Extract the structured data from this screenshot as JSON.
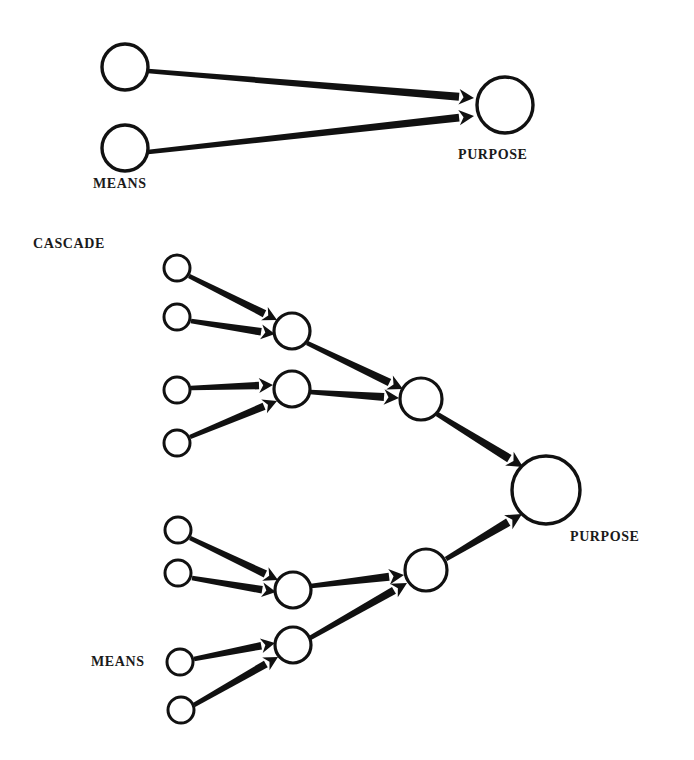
{
  "figure": {
    "background_color": "#ffffff",
    "ink_color": "#111111",
    "title": "",
    "panels": [
      {
        "id": "simple-panel",
        "name": "simple-means-purpose",
        "labels": [
          {
            "id": "simple-means-label",
            "text": "MEANS",
            "x": 93,
            "y": 188,
            "anchor": "start",
            "font_size": 14
          },
          {
            "id": "simple-purpose-label",
            "text": "PURPOSE",
            "x": 458,
            "y": 159,
            "anchor": "start",
            "font_size": 14
          }
        ],
        "nodes": [
          {
            "id": "s-m1",
            "name": "means-node-1",
            "cx": 125,
            "cy": 67,
            "r": 23,
            "stroke_width": 3.4
          },
          {
            "id": "s-m2",
            "name": "means-node-2",
            "cx": 125,
            "cy": 148,
            "r": 23,
            "stroke_width": 3.4
          },
          {
            "id": "s-p",
            "name": "purpose-node",
            "cx": 505,
            "cy": 105,
            "r": 28,
            "stroke_width": 3.4
          }
        ],
        "edges": [
          {
            "id": "s-e1",
            "from": "s-m1",
            "to": "s-p",
            "x1": 148,
            "y1": 71,
            "x2": 474,
            "y2": 98,
            "width": 4.2,
            "head": 15
          },
          {
            "id": "s-e2",
            "from": "s-m2",
            "to": "s-p",
            "x1": 148,
            "y1": 152,
            "x2": 474,
            "y2": 116,
            "width": 4.2,
            "head": 15
          }
        ]
      },
      {
        "id": "cascade-panel",
        "name": "cascade-means-purpose",
        "labels": [
          {
            "id": "cascade-title-label",
            "text": "CASCADE",
            "x": 33,
            "y": 248,
            "anchor": "start",
            "font_size": 14
          },
          {
            "id": "cascade-means-label",
            "text": "MEANS",
            "x": 91,
            "y": 666,
            "anchor": "start",
            "font_size": 14
          },
          {
            "id": "cascade-purpose-label",
            "text": "PURPOSE",
            "x": 570,
            "y": 541,
            "anchor": "start",
            "font_size": 14
          }
        ],
        "nodes": [
          {
            "id": "c-a1",
            "name": "means-node-1",
            "cx": 177,
            "cy": 268,
            "r": 13,
            "stroke_width": 3.0
          },
          {
            "id": "c-a2",
            "name": "means-node-2",
            "cx": 177,
            "cy": 317,
            "r": 13,
            "stroke_width": 3.0
          },
          {
            "id": "c-a3",
            "name": "means-node-3",
            "cx": 177,
            "cy": 390,
            "r": 13,
            "stroke_width": 3.0
          },
          {
            "id": "c-a4",
            "name": "means-node-4",
            "cx": 177,
            "cy": 443,
            "r": 13,
            "stroke_width": 3.0
          },
          {
            "id": "c-a5",
            "name": "means-node-5",
            "cx": 178,
            "cy": 530,
            "r": 13,
            "stroke_width": 3.0
          },
          {
            "id": "c-a6",
            "name": "means-node-6",
            "cx": 178,
            "cy": 573,
            "r": 13,
            "stroke_width": 3.0
          },
          {
            "id": "c-a7",
            "name": "means-node-7",
            "cx": 180,
            "cy": 662,
            "r": 13,
            "stroke_width": 3.0
          },
          {
            "id": "c-a8",
            "name": "means-node-8",
            "cx": 181,
            "cy": 710,
            "r": 13,
            "stroke_width": 3.0
          },
          {
            "id": "c-b1",
            "name": "intermediate-node-1",
            "cx": 292,
            "cy": 331,
            "r": 18,
            "stroke_width": 3.2
          },
          {
            "id": "c-b2",
            "name": "intermediate-node-2",
            "cx": 292,
            "cy": 389,
            "r": 18,
            "stroke_width": 3.2
          },
          {
            "id": "c-b3",
            "name": "intermediate-node-3",
            "cx": 293,
            "cy": 590,
            "r": 18,
            "stroke_width": 3.2
          },
          {
            "id": "c-b4",
            "name": "intermediate-node-4",
            "cx": 293,
            "cy": 645,
            "r": 18,
            "stroke_width": 3.2
          },
          {
            "id": "c-c1",
            "name": "merge-node-upper",
            "cx": 421,
            "cy": 399,
            "r": 21,
            "stroke_width": 3.2
          },
          {
            "id": "c-c2",
            "name": "merge-node-lower",
            "cx": 426,
            "cy": 570,
            "r": 21,
            "stroke_width": 3.2
          },
          {
            "id": "c-p",
            "name": "purpose-node",
            "cx": 546,
            "cy": 490,
            "r": 34,
            "stroke_width": 3.4
          }
        ],
        "edges": [
          {
            "id": "c-e1",
            "from": "c-a1",
            "to": "c-b1",
            "x1": 189,
            "y1": 276,
            "x2": 277,
            "y2": 320,
            "width": 4.0,
            "head": 14
          },
          {
            "id": "c-e2",
            "from": "c-a2",
            "to": "c-b1",
            "x1": 191,
            "y1": 321,
            "x2": 275,
            "y2": 334,
            "width": 4.0,
            "head": 14
          },
          {
            "id": "c-e3",
            "from": "c-a3",
            "to": "c-b2",
            "x1": 191,
            "y1": 388,
            "x2": 273,
            "y2": 385,
            "width": 4.0,
            "head": 14
          },
          {
            "id": "c-e4",
            "from": "c-a4",
            "to": "c-b2",
            "x1": 190,
            "y1": 437,
            "x2": 277,
            "y2": 401,
            "width": 4.0,
            "head": 14
          },
          {
            "id": "c-e5",
            "from": "c-b1",
            "to": "c-c1",
            "x1": 307,
            "y1": 343,
            "x2": 403,
            "y2": 389,
            "width": 4.2,
            "head": 15
          },
          {
            "id": "c-e6",
            "from": "c-b2",
            "to": "c-c1",
            "x1": 310,
            "y1": 392,
            "x2": 399,
            "y2": 398,
            "width": 4.2,
            "head": 15
          },
          {
            "id": "c-e7",
            "from": "c-c1",
            "to": "c-p",
            "x1": 437,
            "y1": 414,
            "x2": 523,
            "y2": 467,
            "width": 4.4,
            "head": 16
          },
          {
            "id": "c-e8",
            "from": "c-a5",
            "to": "c-b3",
            "x1": 190,
            "y1": 538,
            "x2": 278,
            "y2": 580,
            "width": 4.0,
            "head": 14
          },
          {
            "id": "c-e9",
            "from": "c-a6",
            "to": "c-b3",
            "x1": 192,
            "y1": 578,
            "x2": 276,
            "y2": 592,
            "width": 4.0,
            "head": 14
          },
          {
            "id": "c-e10",
            "from": "c-a7",
            "to": "c-b4",
            "x1": 194,
            "y1": 659,
            "x2": 275,
            "y2": 643,
            "width": 4.0,
            "head": 14
          },
          {
            "id": "c-e11",
            "from": "c-a8",
            "to": "c-b4",
            "x1": 194,
            "y1": 705,
            "x2": 278,
            "y2": 657,
            "width": 4.0,
            "head": 14
          },
          {
            "id": "c-e12",
            "from": "c-b3",
            "to": "c-c2",
            "x1": 311,
            "y1": 586,
            "x2": 404,
            "y2": 575,
            "width": 4.2,
            "head": 15
          },
          {
            "id": "c-e13",
            "from": "c-b4",
            "to": "c-c2",
            "x1": 310,
            "y1": 638,
            "x2": 407,
            "y2": 583,
            "width": 4.2,
            "head": 15
          },
          {
            "id": "c-e14",
            "from": "c-c2",
            "to": "c-p",
            "x1": 446,
            "y1": 559,
            "x2": 522,
            "y2": 514,
            "width": 4.4,
            "head": 16
          }
        ]
      }
    ]
  },
  "chart_data": {
    "type": "diagram",
    "annotations": [
      "MEANS",
      "PURPOSE",
      "CASCADE",
      "MEANS",
      "PURPOSE"
    ],
    "panels": [
      {
        "name": "simple",
        "levels": 2,
        "node_counts": [
          2,
          1
        ],
        "edge_count": 2,
        "source_label": "MEANS",
        "sink_label": "PURPOSE"
      },
      {
        "name": "cascade",
        "levels": 4,
        "node_counts": [
          8,
          4,
          2,
          1
        ],
        "edge_count": 14,
        "source_label": "MEANS",
        "sink_label": "PURPOSE",
        "panel_label": "CASCADE"
      }
    ]
  }
}
